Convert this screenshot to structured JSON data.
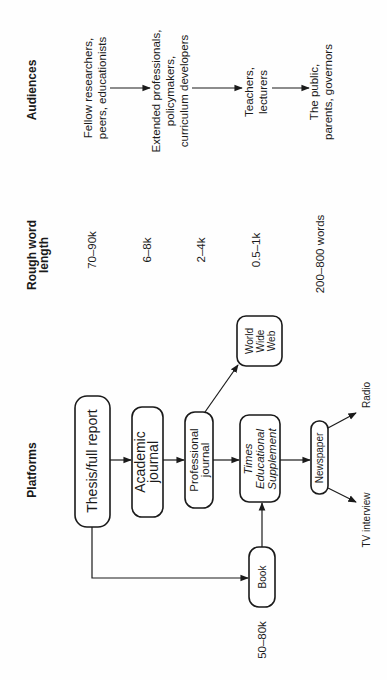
{
  "headers": {
    "platforms": "Platforms",
    "word_length_line1": "Rough word",
    "word_length_line2": "length",
    "audiences": "Audiences"
  },
  "platforms": {
    "thesis": "Thesis/full report",
    "academic_line1": "Academic",
    "academic_line2": "journal",
    "professional_line1": "Professional",
    "professional_line2": "journal",
    "tes_line1": "Times",
    "tes_line2": "Educational",
    "tes_line3": "Supplement",
    "newspaper": "Newspaper",
    "www_line1": "World",
    "www_line2": "Wide",
    "www_line3": "Web",
    "book": "Book",
    "radio": "Radio",
    "tv": "TV interview"
  },
  "word_lengths": {
    "thesis": "70–90k",
    "academic": "6–8k",
    "professional": "2–4k",
    "tes": "0.5–1k",
    "newspaper": "200–800 words",
    "book": "50–80k"
  },
  "audiences": {
    "a1_line1": "Fellow researchers,",
    "a1_line2": "peers, educationists",
    "a2_line1": "Extended professionals,",
    "a2_line2": "policymakers,",
    "a2_line3": "curriculum developers",
    "a3_line1": "Teachers,",
    "a3_line2": "lecturers",
    "a4_line1": "The public,",
    "a4_line2": "parents, governors"
  }
}
